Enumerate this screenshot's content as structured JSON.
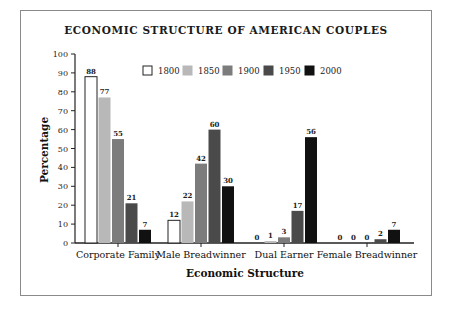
{
  "chart_data": {
    "type": "bar",
    "title": "ECONOMIC STRUCTURE OF AMERICAN COUPLES",
    "xlabel": "Economic Structure",
    "ylabel": "Percentage",
    "ylim": [
      0,
      100
    ],
    "yticks": [
      0,
      10,
      20,
      30,
      40,
      50,
      60,
      70,
      80,
      90,
      100
    ],
    "grid": false,
    "legend_position": "top-inside",
    "categories": [
      "Corporate Family",
      "Male Breadwinner",
      "Dual Earner",
      "Female Breadwinner"
    ],
    "series": [
      {
        "name": "1800",
        "color": "#ffffff",
        "stroke": "#222222",
        "values": [
          88,
          12,
          0,
          0
        ]
      },
      {
        "name": "1850",
        "color": "#b8b8b8",
        "values": [
          77,
          22,
          1,
          0
        ]
      },
      {
        "name": "1900",
        "color": "#7c7c7c",
        "values": [
          55,
          42,
          3,
          0
        ]
      },
      {
        "name": "1950",
        "color": "#4a4a4a",
        "values": [
          21,
          60,
          17,
          2
        ]
      },
      {
        "name": "2000",
        "color": "#111111",
        "values": [
          7,
          30,
          56,
          7
        ]
      }
    ]
  }
}
